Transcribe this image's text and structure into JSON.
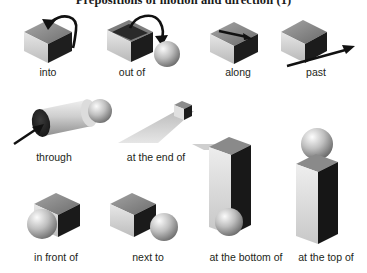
{
  "page": {
    "title": "Prepositions of motion and direction (1)",
    "background_color": "#ffffff",
    "text_color": "#231f20",
    "width": 367,
    "height": 273
  },
  "palette": {
    "cube_top": "#8d8d8d",
    "cube_left": "#d9d9d9",
    "cube_right": "#1c1c1c",
    "sphere_light": "#f2f2f2",
    "sphere_mid": "#b9b9b9",
    "sphere_dark": "#6e6e6e",
    "arrow": "#111111",
    "road": "#d2d2d2",
    "tube": "#cfcfcf"
  },
  "rows": [
    {
      "name": "row-1",
      "items": [
        {
          "id": "into",
          "label": "into",
          "icon": "cube-with-arrow-entering-top-icon"
        },
        {
          "id": "out-of",
          "label": "out of",
          "icon": "open-box-with-arrow-exiting-to-sphere-icon"
        },
        {
          "id": "along",
          "label": "along",
          "icon": "cube-with-arrow-across-top-icon"
        },
        {
          "id": "past",
          "label": "past",
          "icon": "cube-with-arrow-passing-by-icon"
        }
      ]
    },
    {
      "name": "row-2",
      "items": [
        {
          "id": "through",
          "label": "through",
          "icon": "tube-with-arrow-and-sphere-icon"
        },
        {
          "id": "at-the-end-of",
          "label": "at the end of",
          "icon": "road-with-cube-at-far-end-icon"
        },
        {
          "id": "at-the-bottom-of",
          "label": "at the bottom of",
          "icon": "tall-column-with-sphere-at-base-icon"
        },
        {
          "id": "at-the-top-of",
          "label": "at the top of",
          "icon": "tall-column-with-sphere-on-top-icon"
        }
      ]
    },
    {
      "name": "row-3",
      "items": [
        {
          "id": "in-front-of",
          "label": "in front of",
          "icon": "cube-with-sphere-in-front-icon"
        },
        {
          "id": "next-to",
          "label": "next to",
          "icon": "cube-with-sphere-beside-icon"
        }
      ]
    }
  ]
}
